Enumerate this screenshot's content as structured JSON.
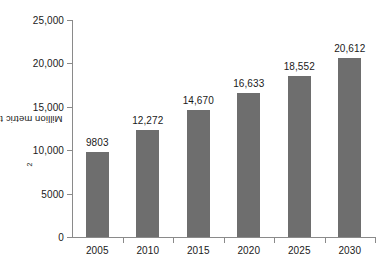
{
  "chart_data": {
    "type": "bar",
    "title": "",
    "subtitle": "",
    "xlabel": "",
    "ylabel": "Million metric tons CO2",
    "ylabel_prefix": "Million metric tons CO",
    "ylabel_subscript": "2",
    "categories": [
      "2005",
      "2010",
      "2015",
      "2020",
      "2025",
      "2030"
    ],
    "values": [
      9803,
      12272,
      14670,
      16633,
      18552,
      20612
    ],
    "value_labels": [
      "9803",
      "12,272",
      "14,670",
      "16,633",
      "18,552",
      "20,612"
    ],
    "ylim": [
      0,
      25000
    ],
    "ytick_values": [
      0,
      5000,
      10000,
      15000,
      20000,
      25000
    ],
    "ytick_labels": [
      "0",
      "5000",
      "10,000",
      "15,000",
      "20,000",
      "25,000"
    ],
    "grid": false,
    "legend": false,
    "legend_position": "none",
    "bar_color": "#6e6e6e",
    "axis_color": "#8a8a8a",
    "text_color": "#1a1a1a",
    "background": "#ffffff"
  }
}
